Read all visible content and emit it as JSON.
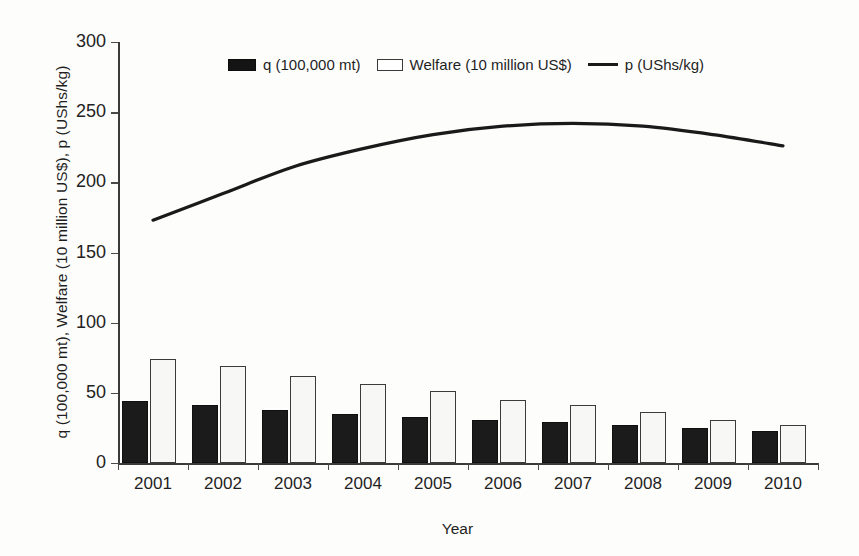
{
  "chart_data": {
    "type": "bar",
    "title": "",
    "xlabel": "Year",
    "ylabel": "q (100,000 mt), Welfare (10 million US$), p (UShs/kg)",
    "categories": [
      "2001",
      "2002",
      "2003",
      "2004",
      "2005",
      "2006",
      "2007",
      "2008",
      "2009",
      "2010"
    ],
    "ylim": [
      0,
      300
    ],
    "yticks": [
      0,
      50,
      100,
      150,
      200,
      250,
      300
    ],
    "ytick_labels": [
      "0",
      "50",
      "100",
      "150",
      "200",
      "250",
      "300"
    ],
    "grid": false,
    "legend_position": "top-center",
    "series": [
      {
        "name": "q (100,000 mt)",
        "kind": "bar",
        "color": "#141414",
        "values": [
          44,
          41,
          38,
          35,
          33,
          31,
          29,
          27,
          25,
          23
        ]
      },
      {
        "name": "Welfare (10 million US$)",
        "kind": "bar",
        "color": "#ffffff",
        "values": [
          74,
          69,
          62,
          56,
          51,
          45,
          41,
          36,
          31,
          27
        ]
      },
      {
        "name": "p (UShs/kg)",
        "kind": "line",
        "color": "#1a1a1a",
        "values": [
          173,
          192,
          211,
          224,
          234,
          240,
          242,
          240,
          234,
          226
        ]
      }
    ]
  },
  "legend": {
    "items": [
      {
        "label": "q (100,000 mt)",
        "marker": "filled-square-swatch"
      },
      {
        "label": "Welfare (10 million US$)",
        "marker": "open-square-swatch"
      },
      {
        "label": "p (UShs/kg)",
        "marker": "line-swatch"
      }
    ]
  },
  "axes": {
    "y_title": "q (100,000 mt), Welfare (10 million US$), p (UShs/kg)",
    "x_title": "Year"
  }
}
